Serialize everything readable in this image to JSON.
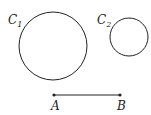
{
  "diagram": {
    "circles": [
      {
        "label": "C",
        "subscript": "1",
        "cx": 53,
        "cy": 46,
        "r": 34
      },
      {
        "label": "C",
        "subscript": "2",
        "cx": 129,
        "cy": 37,
        "r": 19
      }
    ],
    "segment": {
      "start": {
        "label": "A",
        "x": 54,
        "y": 95
      },
      "end": {
        "label": "B",
        "x": 120,
        "y": 95
      }
    },
    "colors": {
      "stroke": "#222222",
      "background": "#ffffff"
    }
  }
}
